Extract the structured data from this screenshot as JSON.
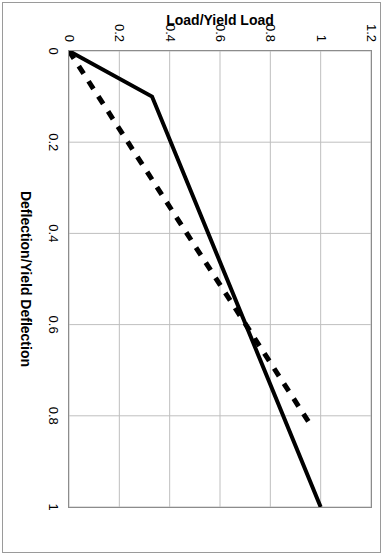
{
  "chart_data": {
    "type": "line",
    "title": "",
    "xlabel": "Deflection/Yield Deflection",
    "ylabel": "Load/Yield Load",
    "xlim": [
      0,
      1
    ],
    "ylim": [
      0,
      1.2
    ],
    "xticks": [
      "0",
      "0.2",
      "0.4",
      "0.6",
      "0.8",
      "1"
    ],
    "xtick_values": [
      0,
      0.2,
      0.4,
      0.6,
      0.8,
      1
    ],
    "yticks": [
      "0",
      "0.2",
      "0.4",
      "0.6",
      "0.8",
      "1",
      "1.2"
    ],
    "ytick_values": [
      0,
      0.2,
      0.4,
      0.6,
      0.8,
      1,
      1.2
    ],
    "grid": true,
    "grid_color": "#bfbfbf",
    "legend": "none",
    "rotation_degrees": 90,
    "series": [
      {
        "name": "solid-curve",
        "style": "solid",
        "color": "#000000",
        "width": 4,
        "x": [
          0,
          0.1,
          1
        ],
        "y": [
          0,
          0.33,
          1
        ]
      },
      {
        "name": "dashed-curve",
        "style": "dashed",
        "color": "#000000",
        "width": 5,
        "dash": "9 9",
        "x": [
          0,
          0.82
        ],
        "y": [
          0,
          0.96
        ]
      }
    ]
  },
  "figure": {
    "border_color": "#9a9a9a",
    "frame_color": "#8c8c8c",
    "background": "#ffffff"
  }
}
